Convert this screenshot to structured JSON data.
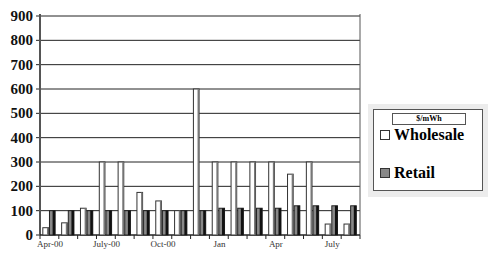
{
  "chart_data": {
    "type": "bar",
    "title": "",
    "xlabel": "",
    "ylabel": "",
    "ylim": [
      0,
      900
    ],
    "yticks": [
      0,
      100,
      200,
      300,
      400,
      500,
      600,
      700,
      800,
      900
    ],
    "grid": true,
    "legend_position": "right",
    "legend_title": "$/mWh",
    "categories": [
      "Apr-00",
      "",
      "",
      "July-00",
      "",
      "",
      "Oct-00",
      "",
      "",
      "Jan",
      "",
      "",
      "Apr",
      "",
      "",
      "July",
      ""
    ],
    "xtick_labels": [
      "Apr-00",
      "July-00",
      "Oct-00",
      "Jan",
      "Apr",
      "July"
    ],
    "series": [
      {
        "name": "Wholesale",
        "color": "#ffffff",
        "values": [
          30,
          50,
          110,
          300,
          300,
          175,
          140,
          100,
          600,
          300,
          300,
          300,
          300,
          250,
          300,
          45,
          45
        ]
      },
      {
        "name": "Retail",
        "color": "#888888",
        "values": [
          100,
          100,
          100,
          100,
          100,
          100,
          100,
          100,
          100,
          110,
          110,
          110,
          110,
          120,
          120,
          120,
          120
        ]
      }
    ]
  },
  "legend": {
    "title": "$/mWh",
    "items": [
      {
        "label": "Wholesale",
        "color": "#ffffff"
      },
      {
        "label": "Retail",
        "color": "#888888"
      }
    ]
  }
}
